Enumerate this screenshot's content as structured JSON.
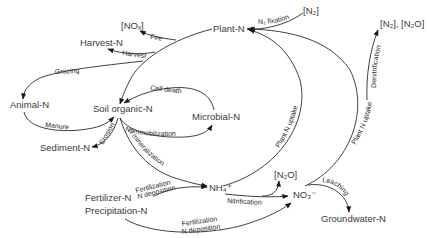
{
  "diagram": {
    "nodes": {
      "plant": "Plant-N",
      "n2_top": "[N₂]",
      "no_x": "[NOₓ]",
      "harvest": "Harvest-N",
      "animal": "Animal-N",
      "soil_organic": "Soil organic-N",
      "microbial": "Microbial-N",
      "sediment": "Sediment-N",
      "fertilizer": "Fertilizer-N",
      "precipitation": "Precipitation-N",
      "nh4": "NH₄⁺",
      "n2o_mid": "[N₂O]",
      "no3": "NO₃⁻",
      "groundwater": "Groundwater-N",
      "n2_n2o": "[N₂], [N₂O]"
    },
    "flows": {
      "n_fixation": "N₂ fixation",
      "fire": "Fire",
      "harvest": "Harvest",
      "grazing": "Grazing",
      "manure": "Manure",
      "cell_death": "Cell death",
      "n_immobilization": "N immobilization",
      "erosion": "Erosion",
      "n_mineralization": "N mineralization",
      "fertilization_1": "Fertilization",
      "n_deposition_1": "N deposition",
      "fertilization_2": "Fertilization",
      "n_deposition_2": "N deposition",
      "nitrification": "Nitrification",
      "leaching": "Leaching",
      "plant_n_uptake_1": "Plant N uptake",
      "plant_n_uptake_2": "Plant N uptake",
      "denitrification": "Denitrification"
    }
  }
}
